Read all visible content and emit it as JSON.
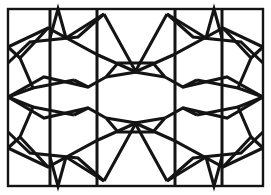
{
  "figure": {
    "kind": "line-drawing",
    "background_color": "#ffffff",
    "stroke_color": "#141414",
    "canvas": {
      "width": 271,
      "height": 195
    }
  },
  "geometry": {
    "frame": {
      "x": 8,
      "y": 9,
      "width": 255,
      "height": 177
    },
    "vertical_lines_full": [
      {
        "name": "vertical-left-inner",
        "x": 50,
        "y1": 9,
        "y2": 186
      },
      {
        "name": "vertical-center-left",
        "x": 97,
        "y1": 9,
        "y2": 186
      },
      {
        "name": "vertical-center-right",
        "x": 175,
        "y1": 9,
        "y2": 186
      },
      {
        "name": "vertical-right-inner",
        "x": 222,
        "y1": 9,
        "y2": 186
      }
    ],
    "chevrons": [
      {
        "name": "chevron-top-left",
        "points": "50,38 58,9 66,38"
      },
      {
        "name": "chevron-top-right",
        "points": "206,38 214,9 222,38"
      },
      {
        "name": "chevron-bottom-left",
        "points": "50,157 58,186 66,157"
      },
      {
        "name": "chevron-bottom-right",
        "points": "206,157 214,186 222,157"
      }
    ],
    "straps": [
      {
        "name": "strap-upper-long-a",
        "points": "8,63 30,42 78,37 104,14"
      },
      {
        "name": "strap-upper-long-b",
        "points": "8,47 48,28 98,55 136,72"
      },
      {
        "name": "strap-upper-long-c",
        "points": "263,63 241,42 193,37 167,14"
      },
      {
        "name": "strap-upper-long-d",
        "points": "263,47 223,28 173,55 135,72"
      },
      {
        "name": "strap-lower-long-a",
        "points": "8,132 30,153 78,158 104,181"
      },
      {
        "name": "strap-lower-long-b",
        "points": "8,148 48,167 98,140 136,123"
      },
      {
        "name": "strap-lower-long-c",
        "points": "263,132 241,153 193,158 167,181"
      },
      {
        "name": "strap-lower-long-d",
        "points": "263,148 223,167 173,140 135,123"
      },
      {
        "name": "strap-left-pent-upper",
        "points": "48,28 20,58 33,88 74,80"
      },
      {
        "name": "strap-left-pent-lower",
        "points": "48,167 20,137 33,107 74,115"
      },
      {
        "name": "strap-right-pent-upper",
        "points": "223,28 251,58 238,88 197,80"
      },
      {
        "name": "strap-right-pent-lower",
        "points": "223,167 251,137 238,107 197,115"
      },
      {
        "name": "strap-mid-left-band",
        "points": "8,97 44,118 88,108 106,118"
      },
      {
        "name": "strap-mid-right-band",
        "points": "263,97 227,118 183,108 165,118"
      },
      {
        "name": "strap-mid-left-band-2",
        "points": "8,97 44,77 88,87 106,77"
      },
      {
        "name": "strap-mid-right-band-2",
        "points": "263,97 227,77 183,87 165,77"
      },
      {
        "name": "strap-top-x-left",
        "points": "104,14 136,72 106,77"
      },
      {
        "name": "strap-top-x-right",
        "points": "167,14 135,72 165,77"
      },
      {
        "name": "strap-bottom-x-left",
        "points": "104,181 136,123 106,118"
      },
      {
        "name": "strap-bottom-x-right",
        "points": "167,181 135,123 165,118"
      },
      {
        "name": "strap-center-top-cap",
        "points": "106,77 118,63 153,63 165,77"
      },
      {
        "name": "strap-center-bottom-cap",
        "points": "106,118 118,132 153,132 165,118"
      },
      {
        "name": "strap-left-edge-upper",
        "points": "20,58 8,47"
      },
      {
        "name": "strap-left-edge-lower",
        "points": "20,137 8,148"
      },
      {
        "name": "strap-right-edge-upper",
        "points": "251,58 263,47"
      },
      {
        "name": "strap-right-edge-lower",
        "points": "251,137 263,148"
      },
      {
        "name": "strap-left-node-upper",
        "points": "33,88 8,97"
      },
      {
        "name": "strap-left-node-lower",
        "points": "33,107 8,97"
      },
      {
        "name": "strap-right-node-upper",
        "points": "238,88 263,97"
      },
      {
        "name": "strap-right-node-lower",
        "points": "238,107 263,97"
      },
      {
        "name": "strap-join-left-upper",
        "points": "74,80 88,87"
      },
      {
        "name": "strap-join-left-lower",
        "points": "74,115 88,108"
      },
      {
        "name": "strap-join-right-upper",
        "points": "197,80 183,87"
      },
      {
        "name": "strap-join-right-lower",
        "points": "197,115 183,108"
      },
      {
        "name": "strap-top-peak-left",
        "points": "66,38 104,14"
      },
      {
        "name": "strap-top-peak-right",
        "points": "206,38 167,14"
      },
      {
        "name": "strap-bottom-peak-left",
        "points": "66,157 104,181"
      },
      {
        "name": "strap-bottom-peak-right",
        "points": "206,157 167,181"
      }
    ]
  }
}
